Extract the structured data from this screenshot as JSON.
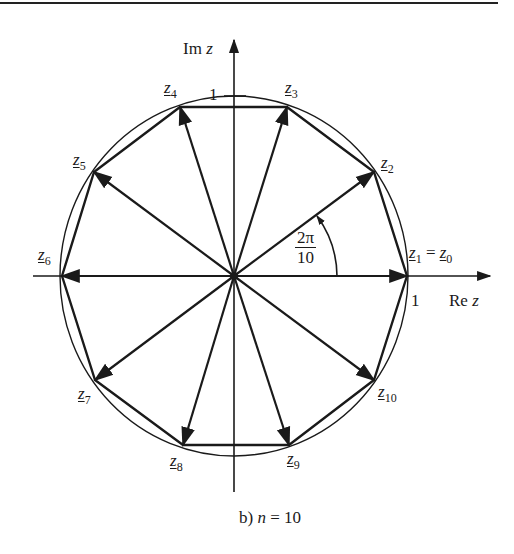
{
  "figure": {
    "caption_prefix": "b)",
    "caption_var": "n",
    "caption_eq": " = 10",
    "n": 10
  },
  "axes": {
    "real_label": "Re",
    "real_var": "z",
    "imag_label": "Im",
    "imag_var": "z",
    "unit_tick_real": "1",
    "unit_tick_imag": "1"
  },
  "angle": {
    "numerator": "2π",
    "denominator": "10"
  },
  "points": [
    {
      "name": "z",
      "sub": "1",
      "extra": " = ",
      "name2": "z",
      "sub2": "0"
    },
    {
      "name": "z",
      "sub": "2"
    },
    {
      "name": "z",
      "sub": "3"
    },
    {
      "name": "z",
      "sub": "4"
    },
    {
      "name": "z",
      "sub": "5"
    },
    {
      "name": "z",
      "sub": "6"
    },
    {
      "name": "z",
      "sub": "7"
    },
    {
      "name": "z",
      "sub": "8"
    },
    {
      "name": "z",
      "sub": "9"
    },
    {
      "name": "z",
      "sub": "10"
    }
  ],
  "colors": {
    "ink": "#1a1a1a",
    "background": "#ffffff"
  }
}
